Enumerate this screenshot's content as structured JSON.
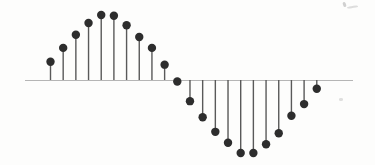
{
  "figure": {
    "name": "discrete-time-sinusoid-stem-plot",
    "background_color": "#fdfdfc",
    "axis_color": "#b5b5b5",
    "stem_color": "#595959",
    "dot_color": "#2d2d2d"
  },
  "chart_data": {
    "type": "scatter",
    "subtype": "stem",
    "title": "",
    "xlabel": "",
    "ylabel": "",
    "grid": false,
    "legend_visible": false,
    "tick_labels_visible": false,
    "x": [
      0,
      1,
      2,
      3,
      4,
      5,
      6,
      7,
      8,
      9,
      10,
      11,
      12,
      13,
      14,
      15,
      16,
      17,
      18,
      19,
      20,
      21
    ],
    "values": [
      0.25,
      0.44,
      0.62,
      0.78,
      0.89,
      0.88,
      0.75,
      0.59,
      0.44,
      0.21,
      -0.02,
      -0.29,
      -0.51,
      -0.71,
      -0.86,
      -1.0,
      -1.0,
      -0.88,
      -0.73,
      -0.49,
      -0.33,
      -0.12
    ],
    "ylim": [
      -1.1,
      1.1
    ],
    "render": {
      "axis_y_px": 80,
      "axis_x_start_px": 25,
      "axis_x_end_px": 353,
      "axis_stroke_px": 1,
      "first_sample_x_px": 50.5,
      "sample_spacing_px": 12.68,
      "unit_amplitude_px": 73,
      "dot_radius_px": 4.2,
      "stem_width_px": 1.4
    }
  },
  "scan_artifacts": [
    {
      "x": 343,
      "y": 2,
      "w": 3,
      "h": 5,
      "rotate": -20,
      "color": "#ababab",
      "opacity": 0.55
    },
    {
      "x": 347,
      "y": 6,
      "w": 11,
      "h": 2,
      "rotate": -8,
      "color": "#bdbdbd",
      "opacity": 0.5
    },
    {
      "x": 339,
      "y": 98,
      "w": 4,
      "h": 3,
      "rotate": 0,
      "color": "#d2d2d2",
      "opacity": 0.7
    }
  ]
}
